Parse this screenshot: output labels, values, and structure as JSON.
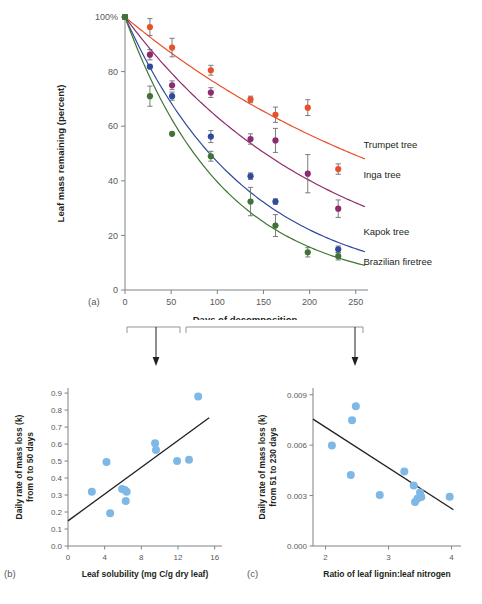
{
  "figure": {
    "panel_a_label": "(a)",
    "panel_b_label": "(b)",
    "panel_c_label": "(c)"
  },
  "chart_data": [
    {
      "id": "panel_a",
      "type": "line",
      "title": "",
      "xlabel": "Days of decomposition",
      "ylabel": "Leaf mass remaining (percent)",
      "xlim": [
        0,
        260
      ],
      "ylim": [
        0,
        100
      ],
      "xticks": [
        0,
        50,
        100,
        150,
        200,
        250
      ],
      "xticklabels": [
        "0",
        "50",
        "100",
        "150",
        "200",
        "250"
      ],
      "yticks": [
        0,
        20,
        40,
        60,
        80,
        100
      ],
      "yticklabels": [
        "0",
        "20",
        "40",
        "60",
        "80",
        "100%"
      ],
      "grid": false,
      "legend_position": "inline-right",
      "series": [
        {
          "name": "Trumpet tree",
          "color": "#E8502A",
          "label_x": 255,
          "label_y": 52,
          "x": [
            0,
            27,
            51,
            93,
            136,
            163,
            198,
            231
          ],
          "y": [
            100,
            96.3,
            88.8,
            80.5,
            69.8,
            64.2,
            66.8,
            44.3
          ],
          "yerr": [
            0.9,
            3.1,
            3.4,
            1.8,
            1.2,
            2.8,
            2.9,
            1.9
          ],
          "fit_x": [
            0,
            260
          ],
          "fit_k": 0.00285,
          "fit_end_y": 48
        },
        {
          "name": "Inga tree",
          "color": "#8E2B6E",
          "label_x": 255,
          "label_y": 41,
          "x": [
            0,
            27,
            51,
            93,
            136,
            163,
            198,
            231
          ],
          "y": [
            100,
            86.2,
            75.0,
            72.3,
            55.3,
            54.8,
            42.6,
            29.8
          ],
          "yerr": [
            0.9,
            1.9,
            1.6,
            1.8,
            1.9,
            4.4,
            7.0,
            3.2
          ],
          "fit_x": [
            0,
            260
          ],
          "fit_k": 0.0048,
          "fit_end_y": 30.5
        },
        {
          "name": "Kapok tree",
          "color": "#2E4A9E",
          "label_x": 255,
          "label_y": 20,
          "x": [
            0,
            27,
            51,
            93,
            136,
            163,
            231
          ],
          "y": [
            100,
            81.8,
            71.0,
            56.2,
            41.7,
            32.4,
            14.9
          ],
          "yerr": [
            0.9,
            0.0,
            1.5,
            2.2,
            1.2,
            1.0,
            1.2
          ],
          "fit_x": [
            0,
            260
          ],
          "fit_k": 0.0084,
          "fit_end_y": 14
        },
        {
          "name": "Brazilian firetree",
          "color": "#3F7434",
          "label_x": 255,
          "label_y": 9,
          "x": [
            0,
            27,
            51,
            93,
            136,
            163,
            198,
            231
          ],
          "y": [
            100,
            71.0,
            57.2,
            49.0,
            32.4,
            23.6,
            13.8,
            12.4
          ],
          "yerr": [
            0.9,
            3.7,
            0.0,
            1.8,
            5.2,
            4.0,
            1.7,
            1.4
          ],
          "fit_x": [
            0,
            260
          ],
          "fit_k": 0.0096,
          "fit_end_y": 9
        }
      ]
    },
    {
      "id": "panel_b",
      "type": "scatter",
      "title": "",
      "xlabel": "Leaf solubility (mg C/g dry leaf)",
      "ylabel": "Daily rate of mass loss (k) from 0 to 50 days",
      "ylabel_line1": "Daily rate of mass loss (k)",
      "ylabel_line2": "from 0 to 50 days",
      "xlim": [
        0,
        16.8
      ],
      "ylim": [
        0.0,
        0.93
      ],
      "xticks": [
        0,
        4,
        8,
        12,
        16
      ],
      "xticklabels": [
        "0",
        "4",
        "8",
        "12",
        "16"
      ],
      "yticks": [
        0.0,
        0.1,
        0.2,
        0.3,
        0.4,
        0.5,
        0.6,
        0.7,
        0.8,
        0.9
      ],
      "yticklabels": [
        "0.0",
        "0.1",
        "0.2",
        "0.3",
        "0.4",
        "0.5",
        "0.6",
        "0.7",
        "0.8",
        "0.9"
      ],
      "grid": false,
      "point_color": "#7FB8E5",
      "points": [
        {
          "x": 2.6,
          "y": 0.32
        },
        {
          "x": 4.2,
          "y": 0.495
        },
        {
          "x": 4.6,
          "y": 0.193
        },
        {
          "x": 5.9,
          "y": 0.335
        },
        {
          "x": 6.2,
          "y": 0.33
        },
        {
          "x": 6.3,
          "y": 0.265
        },
        {
          "x": 6.4,
          "y": 0.32
        },
        {
          "x": 9.5,
          "y": 0.605
        },
        {
          "x": 9.6,
          "y": 0.565
        },
        {
          "x": 11.9,
          "y": 0.5
        },
        {
          "x": 13.2,
          "y": 0.507
        },
        {
          "x": 14.2,
          "y": 0.88
        }
      ],
      "fit": {
        "x0": 0,
        "y0": 0.148,
        "x1": 15.4,
        "y1": 0.755
      }
    },
    {
      "id": "panel_c",
      "type": "scatter",
      "title": "",
      "xlabel": "Ratio of leaf lignin:leaf nitrogen",
      "ylabel": "Daily rate of mass loss (k) from 51 to 230 days",
      "ylabel_line1": "Daily rate of mass loss (k)",
      "ylabel_line2": "from 51 to 230 days",
      "xlim": [
        1.8,
        4.15
      ],
      "ylim": [
        0.0,
        0.0094
      ],
      "xticks": [
        2,
        3,
        4
      ],
      "xticklabels": [
        "2",
        "3",
        "4"
      ],
      "yticks": [
        0.0,
        0.003,
        0.006,
        0.009
      ],
      "yticklabels": [
        "0.000",
        "0.003",
        "0.006",
        "0.009"
      ],
      "grid": false,
      "point_color": "#7FB8E5",
      "points": [
        {
          "x": 2.1,
          "y": 0.00598
        },
        {
          "x": 2.4,
          "y": 0.00423
        },
        {
          "x": 2.42,
          "y": 0.00748
        },
        {
          "x": 2.48,
          "y": 0.00832
        },
        {
          "x": 2.86,
          "y": 0.00304
        },
        {
          "x": 3.25,
          "y": 0.00443
        },
        {
          "x": 3.4,
          "y": 0.0036
        },
        {
          "x": 3.42,
          "y": 0.00262
        },
        {
          "x": 3.46,
          "y": 0.00282
        },
        {
          "x": 3.5,
          "y": 0.00318
        },
        {
          "x": 3.52,
          "y": 0.00292
        },
        {
          "x": 3.97,
          "y": 0.00293
        }
      ],
      "fit": {
        "x0": 1.8,
        "y0": 0.00755,
        "x1": 4.03,
        "y1": 0.00216
      }
    }
  ]
}
